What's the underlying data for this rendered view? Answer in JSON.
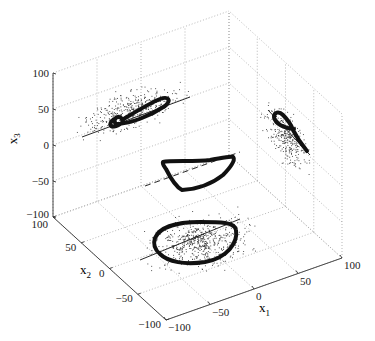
{
  "chart_data": {
    "type": "scatter3d",
    "title": "",
    "xlabel": "x1",
    "ylabel": "x2",
    "zlabel": "x3",
    "xlim": [
      -100,
      100
    ],
    "ylim": [
      -100,
      100
    ],
    "zlim": [
      -100,
      100
    ],
    "grid": true,
    "x_ticks": [
      -100,
      -50,
      0,
      50,
      100
    ],
    "y_ticks": [
      -100,
      -50,
      0,
      50,
      100
    ],
    "z_ticks": [
      -100,
      -50,
      0,
      50,
      100
    ],
    "x_tick_labels": [
      "−100",
      "−50",
      "0",
      "50",
      "100"
    ],
    "y_tick_labels": [
      "−100",
      "−50",
      "0",
      "50",
      "100"
    ],
    "z_tick_labels": [
      "−100",
      "−50",
      "0",
      "50",
      "100"
    ],
    "series": [
      {
        "name": "3D trajectory (limit cycle)",
        "style": "thick loop",
        "description": "closed saddle-shaped loop near origin, x3 from about -10 to 25"
      },
      {
        "name": "projection on x1-x2 plane (x3=-100)",
        "style": "thick loop with scattered points",
        "description": "roughly elliptical cycle spanning x1 -70..50, x2 -40..60"
      },
      {
        "name": "projection on x2-x3 plane (x2=100)",
        "style": "figure-eight loop with scattered points",
        "description": "twisted loop along a diagonal, x3 about 0..60"
      },
      {
        "name": "projection on x1-x3 plane (x1=100)",
        "style": "small loop with tail and scattered points",
        "description": "loop near x3 20..60 with tail toward -20"
      },
      {
        "name": "reference line (3D)",
        "style": "dashed line"
      },
      {
        "name": "reference lines (projections)",
        "style": "solid thin lines"
      }
    ]
  },
  "axes": {
    "x_label": "x",
    "x_sub": "1",
    "y_label": "x",
    "y_sub": "2",
    "z_label": "x",
    "z_sub": "3"
  }
}
